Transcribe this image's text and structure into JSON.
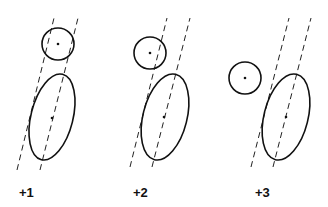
{
  "diagram": {
    "panels": [
      {
        "label": "+1",
        "circle": {
          "cx": 58,
          "cy": 44,
          "r": 16
        },
        "ellipse": {
          "cx": 52,
          "cy": 117,
          "rx": 21,
          "ry": 44,
          "rot": 14
        },
        "lines": [
          [
            17,
            170,
            54,
            18
          ],
          [
            40,
            170,
            78,
            18
          ]
        ],
        "label_pos": [
          19,
          195
        ]
      },
      {
        "label": "+2",
        "circle": {
          "cx": 150,
          "cy": 53,
          "r": 16
        },
        "ellipse": {
          "cx": 164,
          "cy": 117,
          "rx": 22,
          "ry": 44,
          "rot": 14
        },
        "lines": [
          [
            130,
            167,
            167,
            18
          ],
          [
            152,
            167,
            190,
            18
          ]
        ],
        "label_pos": [
          133,
          195
        ]
      },
      {
        "label": "+3",
        "circle": {
          "cx": 245,
          "cy": 78,
          "r": 16
        },
        "ellipse": {
          "cx": 286,
          "cy": 117,
          "rx": 22,
          "ry": 44,
          "rot": 14
        },
        "lines": [
          [
            251,
            167,
            289,
            18
          ],
          [
            273,
            167,
            311,
            18
          ]
        ],
        "label_pos": [
          255,
          195
        ]
      }
    ]
  }
}
